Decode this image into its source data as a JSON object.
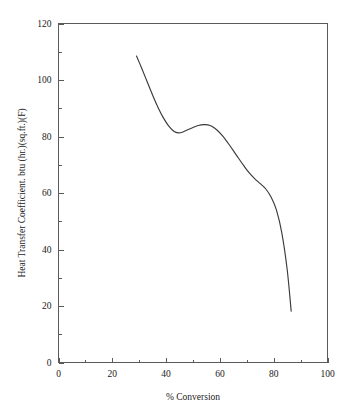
{
  "chart_data": {
    "type": "line",
    "title": "",
    "xlabel": "% Conversion",
    "ylabel": "Heat Transfer Coefficient. btu (hr.)(sq.ft.)(F)",
    "xlim": [
      0,
      100
    ],
    "ylim": [
      0,
      120
    ],
    "grid": false,
    "legend": "none",
    "x_ticks": [
      0,
      20,
      40,
      60,
      80,
      100
    ],
    "x_tick_labels": [
      "0",
      "20",
      "40",
      "60",
      "80",
      "100"
    ],
    "x_minor_tick_step": 10,
    "y_ticks": [
      0,
      20,
      40,
      60,
      80,
      100,
      120
    ],
    "y_tick_labels": [
      "0",
      "20",
      "40",
      "60",
      "80",
      "100",
      "120"
    ],
    "y_minor_tick_step": 10,
    "series": [
      {
        "name": "Heat Transfer Coefficient",
        "color": "#3b3b3b",
        "x": [
          29.0,
          31.0,
          33.0,
          35.0,
          37.0,
          39.0,
          41.0,
          43.0,
          44.5,
          46.0,
          48.0,
          50.0,
          52.0,
          54.0,
          55.5,
          57.0,
          59.0,
          61.0,
          63.0,
          65.0,
          67.0,
          69.0,
          71.0,
          73.0,
          75.0,
          77.0,
          79.0,
          81.0,
          83.0,
          85.0,
          86.5
        ],
        "y": [
          108.5,
          104.0,
          99.3,
          94.6,
          90.3,
          86.6,
          83.7,
          81.8,
          81.3,
          81.5,
          82.4,
          83.2,
          83.9,
          84.2,
          84.1,
          83.6,
          82.2,
          80.2,
          77.7,
          75.0,
          72.2,
          69.5,
          67.0,
          65.0,
          63.3,
          61.5,
          58.6,
          54.0,
          46.0,
          33.0,
          18.2
        ]
      }
    ]
  },
  "axis": {
    "x_label": "% Conversion",
    "y_label": "Heat Transfer Coefficient. btu (hr.)(sq.ft.)(F)"
  },
  "colors": {
    "curve": "#3b3b3b",
    "axis": "#5a5a5a",
    "text": "#1a1a1a",
    "background": "#ffffff"
  }
}
